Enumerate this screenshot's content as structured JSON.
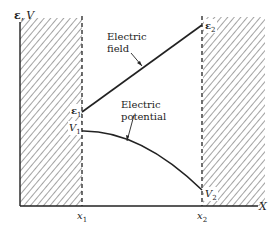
{
  "diagram": {
    "y_axis_label_field": "ε",
    "y_axis_label_sep": ",",
    "y_axis_label_potential": "V",
    "x_axis_label": "X",
    "x1_label": "x",
    "x1_sub": "1",
    "x2_label": "x",
    "x2_sub": "2",
    "e1_label": "ε",
    "e1_sub": "1",
    "e2_label": "ε",
    "e2_sub": "2",
    "v1_label": "V",
    "v1_sub": "1",
    "v2_label": "V",
    "v2_sub": "2",
    "field_label_line1": "Electric",
    "field_label_line2": "field",
    "potential_label_line1": "Electric",
    "potential_label_line2": "potential",
    "colors": {
      "ink": "#222222",
      "hatch": "#555555",
      "background": "#ffffff"
    },
    "curves": [
      {
        "name": "Electric field",
        "shape": "straight line rising",
        "from": "ε1 at x1",
        "to": "ε2 at x2"
      },
      {
        "name": "Electric potential",
        "shape": "concave-down curve falling",
        "from": "V1 at x1",
        "to": "V2 at x2"
      }
    ]
  }
}
